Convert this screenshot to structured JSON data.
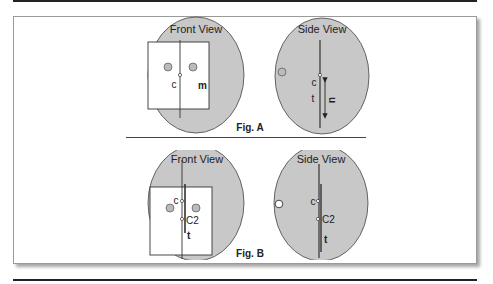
{
  "figures": [
    {
      "id": "A",
      "caption": "Fig. A",
      "front_view": {
        "title": "Front View",
        "center_label": "c",
        "mass_label": "m"
      },
      "side_view": {
        "title": "Side View",
        "center_label": "c",
        "thickness_label": "t",
        "displacement_label": "u"
      }
    },
    {
      "id": "B",
      "caption": "Fig. B",
      "front_view": {
        "title": "Front View",
        "center_label": "c",
        "center2_label": "C2",
        "thickness_label": "t"
      },
      "side_view": {
        "title": "Side View",
        "center_label": "c",
        "center2_label": "C2",
        "thickness_label": "t"
      }
    }
  ],
  "colors": {
    "fill": "#c8c8c8",
    "stroke": "#333333",
    "rule": "#222222",
    "background": "#ffffff"
  }
}
